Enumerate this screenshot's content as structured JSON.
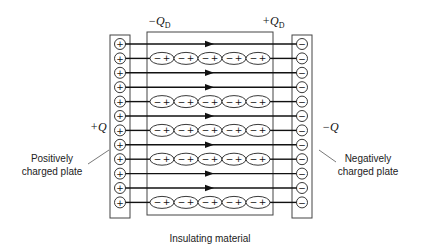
{
  "labels": {
    "plus_q": "+Q",
    "minus_q": "−Q",
    "minus_qd_prefix": "−Q",
    "plus_qd_prefix": "+Q",
    "qd_subscript": "D",
    "positive_plate": [
      "Positively",
      "charged plate"
    ],
    "negative_plate": [
      "Negatively",
      "charged plate"
    ],
    "insulator": "Insulating material"
  },
  "plates": {
    "positive_sign": "+",
    "negative_sign": "−",
    "row_count": 12
  },
  "rows": [
    {
      "type": "arrow"
    },
    {
      "type": "dipole"
    },
    {
      "type": "arrow"
    },
    {
      "type": "arrow"
    },
    {
      "type": "dipole"
    },
    {
      "type": "arrow"
    },
    {
      "type": "dipole"
    },
    {
      "type": "arrow"
    },
    {
      "type": "dipole"
    },
    {
      "type": "arrow"
    },
    {
      "type": "arrow"
    },
    {
      "type": "dipole"
    }
  ],
  "dipole": {
    "count_per_row": 5,
    "neg": "−",
    "pos": "+"
  },
  "colors": {
    "line": "#222222",
    "plate_border": "#444444",
    "background": "#ffffff"
  }
}
